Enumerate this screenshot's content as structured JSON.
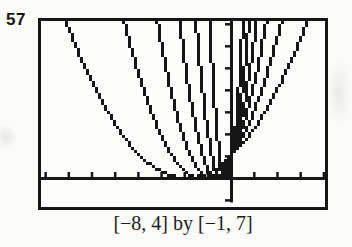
{
  "figure": {
    "exercise_number": "57",
    "caption": "[−8, 4] by [−1, 7]"
  },
  "chart_data": {
    "type": "line",
    "title": "",
    "xlabel": "",
    "ylabel": "",
    "caption": "[−8, 4] by [−1, 7]",
    "xlim": [
      -8,
      4
    ],
    "ylim": [
      -1,
      7
    ],
    "x_tick_interval": 1,
    "y_tick_interval": 1,
    "grid": false,
    "legend": false,
    "style": "graphing-calculator-pixelated",
    "common_point": [
      0,
      1
    ],
    "series": [
      {
        "name": "curve-1-widest",
        "formula": "y = (1 + x/1.95)^2",
        "a": 1.95,
        "vertex": [
          -1.95,
          0
        ],
        "meets_top_left_x": -7.11,
        "meets_top_right_x": 3.21
      },
      {
        "name": "curve-2",
        "formula": "y = (1 + x/1.27)^2",
        "a": 1.27,
        "vertex": [
          -1.27,
          0
        ],
        "meets_top_left_x": -4.63,
        "meets_top_right_x": 2.09
      },
      {
        "name": "curve-3",
        "formula": "y = (1 + x/0.88)^2",
        "a": 0.88,
        "vertex": [
          -0.88,
          0
        ],
        "meets_top_left_x": -3.21,
        "meets_top_right_x": 1.45
      },
      {
        "name": "curve-4",
        "formula": "y = (1 + x/0.62)^2",
        "a": 0.62,
        "vertex": [
          -0.62,
          0
        ],
        "meets_top_left_x": -2.26,
        "meets_top_right_x": 1.02
      },
      {
        "name": "curve-5",
        "formula": "y = (1 + x/0.43)^2",
        "a": 0.43,
        "vertex": [
          -0.43,
          0
        ],
        "meets_top_left_x": -1.57,
        "meets_top_right_x": 0.71
      },
      {
        "name": "curve-6-narrowest",
        "formula": "y = (1 + x/0.27)^2",
        "a": 0.27,
        "vertex": [
          -0.27,
          0
        ],
        "meets_top_left_x": -0.98,
        "meets_top_right_x": 0.44
      }
    ],
    "ink_color": "#161616",
    "paper_color": "#fbfbf8"
  }
}
